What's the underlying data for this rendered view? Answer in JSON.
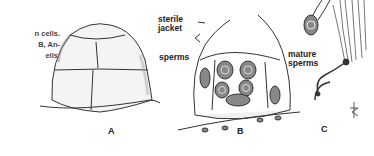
{
  "figure": {
    "caption_fragments": [
      "n  cells.",
      "B,  An-",
      "ells."
    ],
    "labels": {
      "sterile_jacket": [
        "sterile",
        "jacket"
      ],
      "sperms": "sperms",
      "mature_sperms": [
        "mature",
        "sperms"
      ]
    },
    "panels": [
      "A",
      "B",
      "C"
    ],
    "signature": "tE"
  }
}
